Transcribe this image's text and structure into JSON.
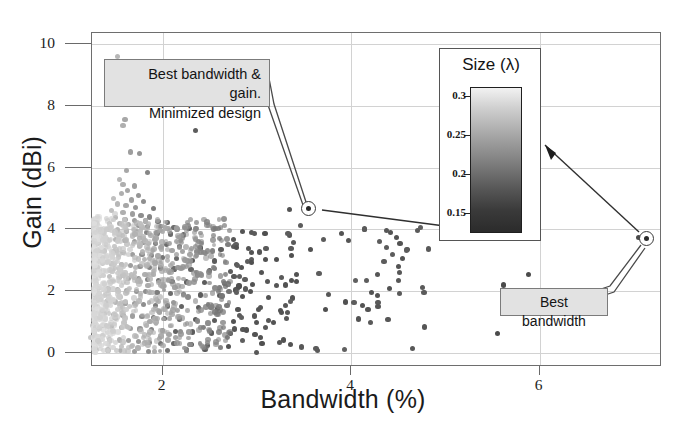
{
  "chart": {
    "type": "scatter",
    "title": "",
    "xlabel": "Bandwidth (%)",
    "ylabel": "Gain (dBi)",
    "xlim": [
      1.25,
      7.3
    ],
    "ylim": [
      -0.45,
      10.35
    ],
    "xticks": [
      2,
      4,
      6
    ],
    "yticks": [
      0,
      2,
      4,
      6,
      8,
      10
    ],
    "xtick_labels": [
      "2",
      "4",
      "6"
    ],
    "ytick_labels": [
      "0",
      "2",
      "4",
      "6",
      "8",
      "10"
    ],
    "grid": "both",
    "legend": "none",
    "colormap_meaning": "marker grey level encodes antenna size in wavelengths"
  },
  "inset": {
    "title": "Size (λ)",
    "type": "colorbar",
    "ticks": [
      "0.3",
      "0.25",
      "0.2",
      "0.15"
    ],
    "tick_values": [
      0.3,
      0.25,
      0.2,
      0.15
    ],
    "top_color": "#f2f2f2",
    "bottom_color": "#2b2b2b"
  },
  "annotations": [
    {
      "name": "best-bandwidth-and-gain",
      "line1": "Best bandwidth & gain.",
      "line2": "Minimized design",
      "points_to": {
        "bandwidth": 3.35,
        "gain": 4.65
      }
    },
    {
      "name": "best-bandwidth",
      "line1": "Best bandwidth",
      "points_to": {
        "bandwidth": 7.05,
        "gain": 3.75
      }
    }
  ],
  "chart_data": {
    "type": "scatter",
    "title": "",
    "xlabel": "Bandwidth (%)",
    "ylabel": "Gain (dBi)",
    "xlim": [
      1.25,
      7.3
    ],
    "ylim": [
      -0.45,
      10.35
    ],
    "xticks": [
      2,
      4,
      6
    ],
    "yticks": [
      0,
      2,
      4,
      6,
      8,
      10
    ],
    "grid": true,
    "legend_position": "none",
    "colorbar": {
      "label": "Size (λ)",
      "ticks": [
        0.15,
        0.2,
        0.25,
        0.3
      ],
      "vmin": 0.13,
      "vmax": 0.31
    },
    "series": [
      {
        "name": "antenna designs",
        "point_note": "x = bandwidth (%), y = gain (dBi), c = size (lambda, grey level)",
        "points": [
          [
            1.52,
            9.6,
            0.18
          ],
          [
            1.6,
            7.55,
            0.2
          ],
          [
            1.58,
            7.35,
            0.19
          ],
          [
            2.35,
            7.2,
            0.29
          ],
          [
            1.66,
            6.5,
            0.21
          ],
          [
            1.75,
            6.45,
            0.22
          ],
          [
            1.62,
            5.9,
            0.2
          ],
          [
            1.84,
            5.85,
            0.24
          ],
          [
            1.54,
            5.6,
            0.18
          ],
          [
            1.58,
            5.45,
            0.19
          ],
          [
            1.7,
            5.4,
            0.21
          ],
          [
            1.63,
            5.25,
            0.2
          ],
          [
            1.56,
            5.15,
            0.19
          ],
          [
            1.74,
            5.1,
            0.22
          ],
          [
            1.48,
            5.0,
            0.17
          ],
          [
            1.67,
            4.95,
            0.21
          ],
          [
            1.8,
            4.9,
            0.23
          ],
          [
            1.52,
            4.82,
            0.18
          ],
          [
            1.61,
            4.78,
            0.2
          ],
          [
            1.71,
            4.7,
            0.22
          ],
          [
            1.9,
            4.68,
            0.25
          ],
          [
            3.35,
            4.65,
            0.3
          ],
          [
            1.46,
            4.6,
            0.17
          ],
          [
            1.58,
            4.55,
            0.19
          ],
          [
            1.68,
            4.5,
            0.21
          ],
          [
            1.77,
            4.45,
            0.23
          ],
          [
            1.86,
            4.4,
            0.24
          ],
          [
            1.5,
            4.38,
            0.18
          ],
          [
            1.6,
            4.33,
            0.2
          ],
          [
            1.7,
            4.3,
            0.21
          ],
          [
            1.82,
            4.27,
            0.24
          ],
          [
            1.95,
            4.25,
            0.26
          ],
          [
            2.05,
            4.22,
            0.27
          ],
          [
            1.44,
            4.2,
            0.17
          ],
          [
            1.54,
            4.18,
            0.19
          ],
          [
            1.64,
            4.15,
            0.2
          ],
          [
            1.74,
            4.12,
            0.22
          ],
          [
            1.84,
            4.1,
            0.24
          ],
          [
            1.98,
            4.08,
            0.26
          ],
          [
            2.12,
            4.05,
            0.27
          ],
          [
            2.28,
            4.02,
            0.28
          ],
          [
            1.42,
            4.0,
            0.16
          ],
          [
            1.52,
            3.98,
            0.18
          ],
          [
            1.62,
            3.95,
            0.2
          ],
          [
            1.72,
            3.92,
            0.22
          ],
          [
            1.83,
            3.9,
            0.24
          ],
          [
            1.94,
            3.88,
            0.25
          ],
          [
            2.08,
            3.85,
            0.27
          ],
          [
            2.22,
            3.82,
            0.28
          ],
          [
            7.05,
            3.75,
            0.31
          ],
          [
            4.42,
            3.9,
            0.3
          ],
          [
            4.48,
            3.75,
            0.3
          ],
          [
            4.3,
            3.6,
            0.29
          ],
          [
            4.52,
            3.55,
            0.3
          ],
          [
            4.38,
            3.42,
            0.29
          ],
          [
            4.6,
            3.35,
            0.3
          ],
          [
            4.44,
            3.2,
            0.29
          ],
          [
            4.55,
            3.05,
            0.3
          ],
          [
            4.35,
            2.95,
            0.29
          ],
          [
            4.5,
            2.8,
            0.3
          ],
          [
            1.4,
            3.7,
            0.16
          ],
          [
            1.5,
            3.68,
            0.18
          ],
          [
            1.6,
            3.65,
            0.2
          ],
          [
            1.7,
            3.6,
            0.21
          ],
          [
            1.8,
            3.58,
            0.23
          ],
          [
            1.92,
            3.55,
            0.25
          ],
          [
            2.04,
            3.5,
            0.27
          ],
          [
            2.18,
            3.45,
            0.28
          ],
          [
            2.4,
            3.4,
            0.29
          ],
          [
            2.62,
            3.35,
            0.29
          ],
          [
            1.38,
            3.3,
            0.16
          ],
          [
            1.48,
            3.28,
            0.18
          ],
          [
            1.58,
            3.25,
            0.19
          ],
          [
            1.68,
            3.2,
            0.21
          ],
          [
            1.78,
            3.18,
            0.23
          ],
          [
            1.88,
            3.15,
            0.24
          ],
          [
            2.0,
            3.1,
            0.26
          ],
          [
            2.15,
            3.05,
            0.27
          ],
          [
            2.32,
            3.0,
            0.29
          ],
          [
            2.55,
            2.98,
            0.29
          ],
          [
            1.36,
            2.9,
            0.16
          ],
          [
            1.46,
            2.88,
            0.17
          ],
          [
            1.56,
            2.85,
            0.19
          ],
          [
            1.66,
            2.82,
            0.21
          ],
          [
            1.76,
            2.8,
            0.22
          ],
          [
            1.86,
            2.78,
            0.24
          ],
          [
            1.98,
            2.75,
            0.26
          ],
          [
            2.12,
            2.72,
            0.27
          ],
          [
            2.3,
            2.7,
            0.28
          ],
          [
            2.5,
            2.68,
            0.29
          ],
          [
            2.72,
            2.65,
            0.29
          ],
          [
            3.05,
            2.6,
            0.3
          ],
          [
            3.42,
            2.55,
            0.3
          ],
          [
            5.88,
            2.55,
            0.31
          ],
          [
            1.34,
            2.5,
            0.16
          ],
          [
            1.44,
            2.48,
            0.17
          ],
          [
            1.54,
            2.45,
            0.19
          ],
          [
            1.64,
            2.42,
            0.2
          ],
          [
            1.74,
            2.4,
            0.22
          ],
          [
            1.84,
            2.38,
            0.24
          ],
          [
            1.96,
            2.35,
            0.26
          ],
          [
            2.1,
            2.32,
            0.27
          ],
          [
            2.25,
            2.3,
            0.28
          ],
          [
            2.44,
            2.28,
            0.29
          ],
          [
            2.66,
            2.25,
            0.29
          ],
          [
            2.95,
            2.22,
            0.3
          ],
          [
            3.3,
            2.2,
            0.3
          ],
          [
            5.62,
            2.2,
            0.31
          ],
          [
            1.32,
            2.1,
            0.16
          ],
          [
            1.42,
            2.08,
            0.17
          ],
          [
            1.52,
            2.05,
            0.19
          ],
          [
            1.62,
            2.02,
            0.2
          ],
          [
            1.72,
            2.0,
            0.22
          ],
          [
            1.82,
            1.98,
            0.23
          ],
          [
            1.94,
            1.95,
            0.25
          ],
          [
            2.08,
            1.92,
            0.27
          ],
          [
            2.22,
            1.9,
            0.28
          ],
          [
            2.4,
            1.88,
            0.29
          ],
          [
            2.6,
            1.85,
            0.29
          ],
          [
            2.85,
            1.82,
            0.3
          ],
          [
            3.12,
            1.8,
            0.3
          ],
          [
            3.38,
            1.78,
            0.3
          ],
          [
            4.22,
            1.95,
            0.3
          ],
          [
            4.28,
            1.85,
            0.3
          ],
          [
            1.3,
            1.7,
            0.16
          ],
          [
            1.4,
            1.68,
            0.17
          ],
          [
            1.5,
            1.65,
            0.18
          ],
          [
            1.6,
            1.62,
            0.2
          ],
          [
            1.7,
            1.6,
            0.21
          ],
          [
            1.8,
            1.58,
            0.23
          ],
          [
            1.92,
            1.55,
            0.25
          ],
          [
            2.05,
            1.52,
            0.27
          ],
          [
            2.2,
            1.5,
            0.28
          ],
          [
            2.38,
            1.48,
            0.29
          ],
          [
            2.58,
            1.45,
            0.29
          ],
          [
            2.8,
            1.42,
            0.3
          ],
          [
            3.02,
            1.4,
            0.3
          ],
          [
            3.25,
            1.38,
            0.3
          ],
          [
            4.12,
            1.55,
            0.3
          ],
          [
            4.18,
            1.4,
            0.3
          ],
          [
            1.28,
            1.3,
            0.16
          ],
          [
            1.38,
            1.28,
            0.17
          ],
          [
            1.48,
            1.25,
            0.18
          ],
          [
            1.58,
            1.22,
            0.2
          ],
          [
            1.68,
            1.2,
            0.21
          ],
          [
            1.78,
            1.18,
            0.23
          ],
          [
            1.9,
            1.15,
            0.25
          ],
          [
            2.02,
            1.12,
            0.27
          ],
          [
            2.18,
            1.1,
            0.28
          ],
          [
            2.35,
            1.08,
            0.29
          ],
          [
            2.55,
            1.05,
            0.29
          ],
          [
            2.75,
            1.02,
            0.3
          ],
          [
            3.0,
            1.0,
            0.3
          ],
          [
            3.18,
            0.98,
            0.3
          ],
          [
            4.08,
            1.1,
            0.3
          ],
          [
            1.26,
            0.9,
            0.16
          ],
          [
            1.36,
            0.88,
            0.17
          ],
          [
            1.46,
            0.85,
            0.18
          ],
          [
            1.56,
            0.82,
            0.19
          ],
          [
            1.66,
            0.8,
            0.21
          ],
          [
            1.76,
            0.78,
            0.22
          ],
          [
            1.88,
            0.75,
            0.24
          ],
          [
            2.0,
            0.72,
            0.26
          ],
          [
            2.14,
            0.7,
            0.28
          ],
          [
            2.32,
            0.68,
            0.29
          ],
          [
            2.52,
            0.65,
            0.29
          ],
          [
            2.72,
            0.62,
            0.3
          ],
          [
            2.98,
            0.6,
            0.3
          ],
          [
            5.55,
            0.62,
            0.31
          ],
          [
            1.24,
            0.5,
            0.16
          ],
          [
            1.34,
            0.48,
            0.17
          ],
          [
            1.44,
            0.45,
            0.18
          ],
          [
            1.54,
            0.42,
            0.19
          ],
          [
            1.64,
            0.4,
            0.21
          ],
          [
            1.74,
            0.38,
            0.22
          ],
          [
            1.86,
            0.35,
            0.24
          ],
          [
            1.98,
            0.32,
            0.26
          ],
          [
            2.12,
            0.3,
            0.27
          ],
          [
            2.3,
            0.28,
            0.29
          ],
          [
            2.48,
            0.25,
            0.29
          ],
          [
            2.7,
            0.22,
            0.3
          ],
          [
            3.28,
            0.42,
            0.3
          ],
          [
            1.3,
            0.12,
            0.16
          ],
          [
            1.42,
            0.1,
            0.17
          ],
          [
            1.55,
            0.08,
            0.19
          ],
          [
            1.7,
            0.06,
            0.21
          ],
          [
            1.85,
            0.05,
            0.23
          ],
          [
            2.05,
            0.08,
            0.26
          ],
          [
            2.25,
            0.1,
            0.28
          ],
          [
            2.45,
            0.12,
            0.29
          ]
        ]
      }
    ]
  }
}
